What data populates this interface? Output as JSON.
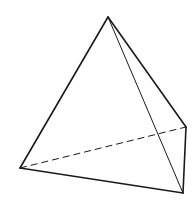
{
  "diagram": {
    "type": "tetrahedron",
    "background": "#ffffff",
    "stroke_color": "#1a1a1a",
    "vertices": {
      "apex": [
        108,
        17
      ],
      "left": [
        20,
        168
      ],
      "back_right": [
        186,
        127
      ],
      "front_right": [
        183,
        193
      ]
    },
    "edges": [
      {
        "name": "edge-apex-left",
        "from": "apex",
        "to": "left",
        "style": "solid",
        "width": 1.6
      },
      {
        "name": "edge-apex-back-right",
        "from": "apex",
        "to": "back_right",
        "style": "solid",
        "width": 1.6
      },
      {
        "name": "edge-apex-front-right",
        "from": "apex",
        "to": "front_right",
        "style": "solid",
        "width": 1.0
      },
      {
        "name": "edge-left-front-right",
        "from": "left",
        "to": "front_right",
        "style": "solid",
        "width": 1.6
      },
      {
        "name": "edge-back-right-front-right",
        "from": "back_right",
        "to": "front_right",
        "style": "solid",
        "width": 1.6
      },
      {
        "name": "edge-left-back-right",
        "from": "left",
        "to": "back_right",
        "style": "dashed",
        "width": 1.0,
        "dash": "7 4"
      }
    ]
  }
}
